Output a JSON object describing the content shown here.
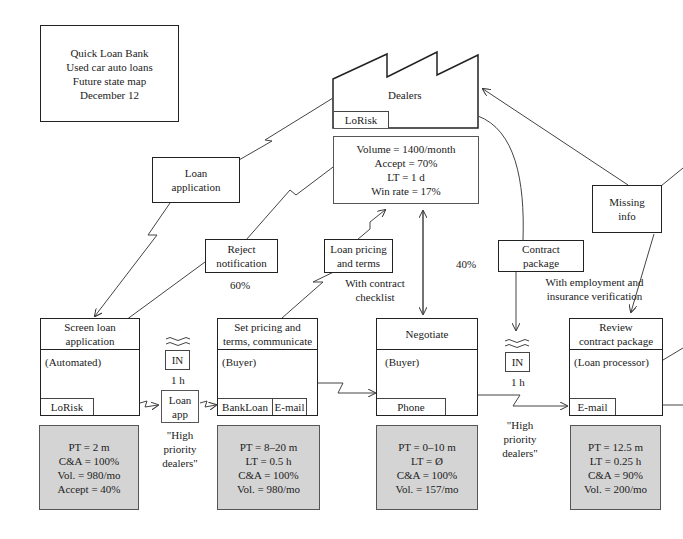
{
  "title_box": {
    "lines": [
      "Quick Loan Bank",
      "Used car auto loans",
      "Future state map",
      "December 12"
    ]
  },
  "customer": {
    "label": "Dealers",
    "system": "LoRisk",
    "data": [
      "Volume = 1400/month",
      "Accept = 70%",
      "LT = 1 d",
      "Win rate = 17%"
    ]
  },
  "info_flows": {
    "loan_application": [
      "Loan",
      "application"
    ],
    "reject_notification": [
      "Reject",
      "notification"
    ],
    "reject_pct": "60%",
    "loan_pricing": [
      "Loan pricing",
      "and terms"
    ],
    "loan_pricing_note": [
      "With contract",
      "checklist"
    ],
    "negotiate_pct": "40%",
    "contract_package": [
      "Contract",
      "package"
    ],
    "contract_note": [
      "With employment and",
      "insurance verification"
    ],
    "missing_info": [
      "Missing",
      "info"
    ]
  },
  "processes": [
    {
      "title": [
        "Screen loan",
        "application"
      ],
      "role": "(Automated)",
      "systems": [
        "LoRisk"
      ],
      "data": [
        "PT = 2 m",
        "C&A = 100%",
        "Vol. = 980/mo",
        "Accept = 40%"
      ]
    },
    {
      "title": [
        "Set pricing and",
        "terms, communicate"
      ],
      "role": "(Buyer)",
      "systems": [
        "BankLoan",
        "E-mail"
      ],
      "data": [
        "PT = 8–20 m",
        "LT = 0.5 h",
        "C&A = 100%",
        "Vol. = 980/mo"
      ]
    },
    {
      "title": [
        "Negotiate"
      ],
      "role": "(Buyer)",
      "systems": [
        "Phone"
      ],
      "data": [
        "PT = 0–10 m",
        "LT = Ø",
        "C&A = 100%",
        "Vol. = 157/mo"
      ]
    },
    {
      "title": [
        "Review",
        "contract package"
      ],
      "role": "(Loan processor)",
      "systems": [
        "E-mail"
      ],
      "data": [
        "PT = 12.5 m",
        "LT = 0.25 h",
        "C&A = 90%",
        "Vol. = 200/mo"
      ]
    }
  ],
  "inventory": [
    {
      "label": "IN",
      "time": "1 h"
    },
    {
      "label": "IN",
      "time": "1 h"
    }
  ],
  "loan_app_box": [
    "Loan",
    "app"
  ],
  "priority_notes": [
    [
      "\"High",
      "priority",
      "dealers\""
    ],
    [
      "\"High",
      "priority",
      "dealers\""
    ]
  ]
}
